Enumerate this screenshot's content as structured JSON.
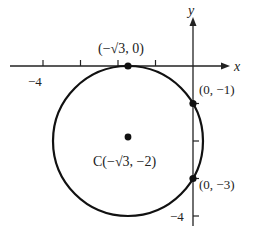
{
  "diagram": {
    "type": "circle-on-coordinate-plane",
    "axes": {
      "x_label": "x",
      "y_label": "y",
      "x_tick_labels": [
        {
          "value": -4,
          "text": "−4"
        }
      ],
      "y_tick_labels": [
        {
          "value": -4,
          "text": "−4"
        }
      ]
    },
    "circle": {
      "center_label": "C(−√3, −2)",
      "center": [
        -1.732,
        -2
      ],
      "radius": 2
    },
    "points": [
      {
        "label": "(−√3, 0)",
        "coords": [
          -1.732,
          0
        ]
      },
      {
        "label": "(0, −1)",
        "coords": [
          0,
          -1
        ]
      },
      {
        "label": "(0, −3)",
        "coords": [
          0,
          -3
        ]
      },
      {
        "label": "C(−√3, −2)",
        "coords": [
          -1.732,
          -2
        ]
      }
    ],
    "colors": {
      "stroke": "#111111",
      "background": "#ffffff"
    }
  }
}
